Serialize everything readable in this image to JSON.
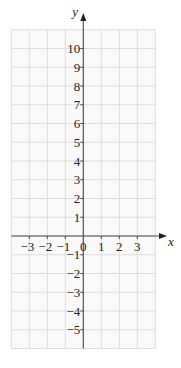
{
  "chart_data": {
    "type": "scatter",
    "title": "",
    "xlabel": "x",
    "ylabel": "y",
    "x_ticks": [
      -3,
      -2,
      -1,
      0,
      1,
      2,
      3
    ],
    "y_ticks": [
      10,
      9,
      8,
      7,
      6,
      5,
      4,
      3,
      2,
      1,
      -1,
      -2,
      -3,
      -4,
      -5
    ],
    "xlim": [
      -4,
      4
    ],
    "ylim": [
      -6,
      11
    ],
    "grid": true,
    "series": [],
    "legend": null,
    "colors": {
      "grid": "#dedede",
      "grid_bg": "#f9f9f9",
      "axis": "#4a4a4a",
      "text": "#222222"
    }
  },
  "axes": {
    "x_label": "x",
    "y_label": "y",
    "origin_label": "0"
  }
}
